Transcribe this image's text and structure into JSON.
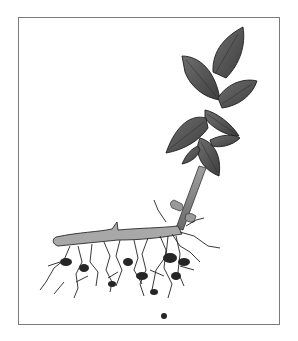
{
  "figure": {
    "frame_color": "#7a7a7a",
    "leaf_color": "#5a5a5a",
    "root_color": "#2a2a2a",
    "stem_color": "#8c8c8c"
  }
}
